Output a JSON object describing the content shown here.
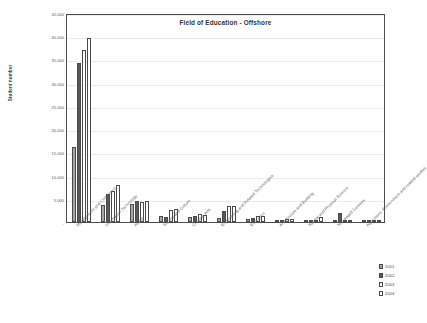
{
  "chart_data": {
    "type": "bar",
    "title": "Field of Education - Offshore",
    "xlabel": "",
    "ylabel": "Student number",
    "ylim": [
      0,
      45000
    ],
    "yticks": [
      "-",
      "5,000",
      "10,000",
      "15,000",
      "20,000",
      "25,000",
      "30,000",
      "35,000",
      "40,000",
      "45,000"
    ],
    "ytick_values": [
      0,
      5000,
      10000,
      15000,
      20000,
      25000,
      30000,
      35000,
      40000,
      45000
    ],
    "grid": true,
    "legend_position": "bottom-right",
    "categories": [
      "Management and Commerce",
      "Information Technology",
      "Health",
      "Society and Culture",
      "Creative Arts",
      "Engineering and Related Technologies",
      "Education",
      "Architecture and Building",
      "Natural and Physical Science",
      "Non Award Courses",
      "Agriculture, Environment and related studies"
    ],
    "series": [
      {
        "name": "2001",
        "color": "#a6a6a6",
        "values": [
          16100,
          3700,
          3800,
          1200,
          1000,
          900,
          600,
          400,
          300,
          200,
          60
        ]
      },
      {
        "name": "2002",
        "color": "#595959",
        "values": [
          34200,
          6000,
          4600,
          1100,
          1300,
          2300,
          900,
          500,
          400,
          2000,
          80
        ]
      },
      {
        "name": "2003",
        "color": "#ffffff",
        "values": [
          37100,
          6700,
          4400,
          2600,
          1700,
          3400,
          1300,
          700,
          500,
          500,
          60
        ]
      },
      {
        "name": "2004",
        "color": "#ffffff",
        "values": [
          39700,
          7900,
          4500,
          2900,
          1600,
          3500,
          1400,
          600,
          1000,
          120,
          50
        ]
      }
    ]
  },
  "legend": {
    "items": [
      {
        "label": "2001"
      },
      {
        "label": "2002"
      },
      {
        "label": "2003"
      },
      {
        "label": "2004"
      }
    ]
  }
}
